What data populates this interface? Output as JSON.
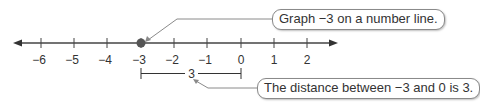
{
  "diagram": {
    "type": "number-line",
    "range": [
      -6,
      2
    ],
    "ticks": [
      {
        "value": -6,
        "label": "−6"
      },
      {
        "value": -5,
        "label": "−5"
      },
      {
        "value": -4,
        "label": "−4"
      },
      {
        "value": -3,
        "label": "−3"
      },
      {
        "value": -2,
        "label": "−2"
      },
      {
        "value": -1,
        "label": "−1"
      },
      {
        "value": 0,
        "label": "0"
      },
      {
        "value": 1,
        "label": "1"
      },
      {
        "value": 2,
        "label": "2"
      }
    ],
    "plotted_point": -3,
    "distance_segment": {
      "from": -3,
      "to": 0,
      "label": "3"
    },
    "colors": {
      "axis": "#444444",
      "point": "#555555",
      "callout_border": "#8a8a8a",
      "leader": "#8a8a8a"
    }
  },
  "callouts": {
    "graph_point": "Graph −3 on a number line.",
    "distance": "The distance between −3 and 0 is 3."
  }
}
